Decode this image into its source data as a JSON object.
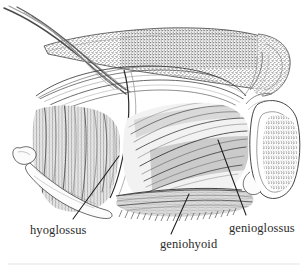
{
  "figure": {
    "kind": "anatomical-line-illustration",
    "view": "lateral / sagittal-oblique dissection",
    "background_color": "#ffffff",
    "ink_color": "#1c1c1c",
    "label_color": "#2b2b2b",
    "width": 308,
    "height": 272
  },
  "labels": [
    {
      "id": "hyoglossus",
      "text": "hyoglossus",
      "text_x": 30,
      "text_y": 234,
      "leader_from_x": 73,
      "leader_from_y": 219,
      "leader_to_x": 119,
      "leader_to_y": 156
    },
    {
      "id": "geniohyoid",
      "text": "geniohyoid",
      "text_x": 160,
      "text_y": 248,
      "leader_from_x": 171,
      "leader_from_y": 234,
      "leader_to_x": 189,
      "leader_to_y": 194
    },
    {
      "id": "genioglossus",
      "text": "genioglossus",
      "text_x": 229,
      "text_y": 232,
      "leader_from_x": 246,
      "leader_from_y": 215,
      "leader_to_x": 218,
      "leader_to_y": 140
    }
  ],
  "structures": [
    {
      "id": "tongue-body",
      "name": "tongue body (stippled cut surface)"
    },
    {
      "id": "tendon-strands",
      "name": "fibrous strands at upper left"
    },
    {
      "id": "hyoglossus-muscle",
      "name": "hyoglossus muscle belly"
    },
    {
      "id": "genioglossus-muscle",
      "name": "genioglossus fan-shaped fibers"
    },
    {
      "id": "geniohyoid-muscle",
      "name": "geniohyoid muscle band"
    },
    {
      "id": "hyoid-bone",
      "name": "hyoid bone, greater horn"
    },
    {
      "id": "mandible-section",
      "name": "mandible cross-section with trabecular bone"
    }
  ],
  "footer_rule": {
    "visible": true,
    "y": 264,
    "color": "#ececec"
  }
}
